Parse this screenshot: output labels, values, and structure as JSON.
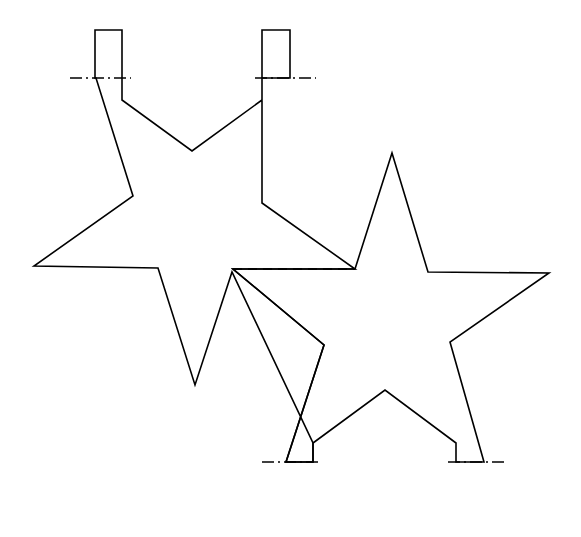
{
  "drawing": {
    "title": "Two overlapping five-point star outlines with mounting tabs",
    "canvas": {
      "width": 581,
      "height": 537,
      "background": "#ffffff"
    },
    "line_color": "#000000",
    "line_weights": {
      "outline": 1.6,
      "hidden": 1.5,
      "center": 1.5
    },
    "line_styles": {
      "outline": "solid",
      "hidden": "dashed",
      "center": "dash-dot"
    },
    "shapes": {
      "upper_left_star": {
        "name": "upper-left-star",
        "style": "solid",
        "path": "M 95,30 L 122,30 L 122,100 L 192,151 L 262,100 L 262,30 L 290,30 L 290,78 L 262,78 L 262,203 L 355,269 L 233,269 L 324,345 L 286,462 L 313,462 L 313,443 L 232,272 L 195,385 L 158,268 L 34,266 L 133,196 L 96,78 L 95,78 Z"
      },
      "lower_right_star": {
        "name": "lower-right-star",
        "style": "solid",
        "path": "M 355,269 L 392,153 L 428,272 L 549,273 L 450,342 L 484,462 L 456,462 L 456,443 L 385,390 L 313,443 L 313,462 L 286,462 L 324,345 L 233,269 Z"
      }
    },
    "tabs": [
      {
        "name": "tab-top-left",
        "x": 95,
        "y": 30,
        "width": 27,
        "height": 48
      },
      {
        "name": "tab-top-right",
        "x": 262,
        "y": 30,
        "width": 28,
        "height": 48
      },
      {
        "name": "tab-bottom-left",
        "x": 286,
        "y": 462,
        "width": 27,
        "height": 45
      },
      {
        "name": "tab-bottom-right",
        "x": 456,
        "y": 462,
        "width": 28,
        "height": 45
      }
    ],
    "hidden_lines": [
      {
        "name": "hidden-edge-center",
        "x1": 233,
        "y1": 269,
        "x2": 355,
        "y2": 269
      }
    ],
    "centerlines": [
      {
        "name": "centerline-top-left",
        "x1": 70,
        "y1": 78,
        "x2": 131,
        "y2": 78
      },
      {
        "name": "centerline-top-right",
        "x1": 255,
        "y1": 78,
        "x2": 316,
        "y2": 78
      },
      {
        "name": "centerline-bottom-left",
        "x1": 262,
        "y1": 462,
        "x2": 322,
        "y2": 462
      },
      {
        "name": "centerline-bottom-right",
        "x1": 448,
        "y1": 462,
        "x2": 508,
        "y2": 462
      }
    ]
  }
}
